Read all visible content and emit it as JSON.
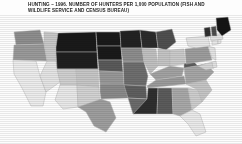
{
  "title": {
    "line1": "HUNTING – 1996.  NUMBER OF HUNTERS PER 1,000 POPULATION (FISH AND",
    "line2": "WILDLIFE SERVICE AND CENSUS BUREAU)"
  },
  "chart_data": {
    "type": "choropleth-map",
    "title": "HUNTING – 1996.  NUMBER OF HUNTERS PER 1,000 POPULATION (FISH AND WILDLIFE SERVICE AND CENSUS BUREAU)",
    "source": "Fish and Wildlife Service and Census Bureau",
    "year": "1996",
    "unit": "hunters per 1,000 population",
    "legend_shown": false,
    "region_label_shown": false,
    "shading_scheme": "grayscale halftone; darker = more hunters per 1,000 population",
    "shades": {
      "very_high": "#1a1a1a",
      "high": "#4a4a4a",
      "medium": "#8e8e8e",
      "low": "#c2c2c2",
      "very_low": "#e6e6e6"
    },
    "states": [
      {
        "code": "WA",
        "name": "Washington",
        "class": "medium",
        "fill": "#8e8e8e"
      },
      {
        "code": "OR",
        "name": "Oregon",
        "class": "medium",
        "fill": "#9a9a9a"
      },
      {
        "code": "CA",
        "name": "California",
        "class": "very_low",
        "fill": "#ececec"
      },
      {
        "code": "ID",
        "name": "Idaho",
        "class": "low",
        "fill": "#c8c8c8"
      },
      {
        "code": "NV",
        "name": "Nevada",
        "class": "very_low",
        "fill": "#e4e4e4"
      },
      {
        "code": "MT",
        "name": "Montana",
        "class": "very_high",
        "fill": "#1a1a1a"
      },
      {
        "code": "WY",
        "name": "Wyoming",
        "class": "very_high",
        "fill": "#1f1f1f"
      },
      {
        "code": "UT",
        "name": "Utah",
        "class": "low",
        "fill": "#cfcfcf"
      },
      {
        "code": "AZ",
        "name": "Arizona",
        "class": "very_low",
        "fill": "#e8e8e8"
      },
      {
        "code": "CO",
        "name": "Colorado",
        "class": "low",
        "fill": "#c6c6c6"
      },
      {
        "code": "NM",
        "name": "New Mexico",
        "class": "low",
        "fill": "#d2d2d2"
      },
      {
        "code": "ND",
        "name": "North Dakota",
        "class": "very_high",
        "fill": "#1a1a1a"
      },
      {
        "code": "SD",
        "name": "South Dakota",
        "class": "very_high",
        "fill": "#1a1a1a"
      },
      {
        "code": "NE",
        "name": "Nebraska",
        "class": "high",
        "fill": "#5a5a5a"
      },
      {
        "code": "KS",
        "name": "Kansas",
        "class": "medium",
        "fill": "#979797"
      },
      {
        "code": "OK",
        "name": "Oklahoma",
        "class": "medium",
        "fill": "#8a8a8a"
      },
      {
        "code": "TX",
        "name": "Texas",
        "class": "medium",
        "fill": "#9e9e9e"
      },
      {
        "code": "MN",
        "name": "Minnesota",
        "class": "very_high",
        "fill": "#222222"
      },
      {
        "code": "IA",
        "name": "Iowa",
        "class": "medium",
        "fill": "#8d8d8d"
      },
      {
        "code": "MO",
        "name": "Missouri",
        "class": "high",
        "fill": "#6e6e6e"
      },
      {
        "code": "AR",
        "name": "Arkansas",
        "class": "high",
        "fill": "#5f5f5f"
      },
      {
        "code": "LA",
        "name": "Louisiana",
        "class": "high",
        "fill": "#6b6b6b"
      },
      {
        "code": "WI",
        "name": "Wisconsin",
        "class": "very_high",
        "fill": "#2b2b2b"
      },
      {
        "code": "IL",
        "name": "Illinois",
        "class": "low",
        "fill": "#c0c0c0"
      },
      {
        "code": "MI",
        "name": "Michigan",
        "class": "high",
        "fill": "#4f4f4f"
      },
      {
        "code": "IN",
        "name": "Indiana",
        "class": "low",
        "fill": "#c4c4c4"
      },
      {
        "code": "OH",
        "name": "Ohio",
        "class": "low",
        "fill": "#cacaca"
      },
      {
        "code": "KY",
        "name": "Kentucky",
        "class": "medium",
        "fill": "#a2a2a2"
      },
      {
        "code": "TN",
        "name": "Tennessee",
        "class": "medium",
        "fill": "#9b9b9b"
      },
      {
        "code": "MS",
        "name": "Mississippi",
        "class": "very_high",
        "fill": "#2f2f2f"
      },
      {
        "code": "AL",
        "name": "Alabama",
        "class": "high",
        "fill": "#5b5b5b"
      },
      {
        "code": "GA",
        "name": "Georgia",
        "class": "medium",
        "fill": "#a8a8a8"
      },
      {
        "code": "FL",
        "name": "Florida",
        "class": "very_low",
        "fill": "#eaeaea"
      },
      {
        "code": "SC",
        "name": "South Carolina",
        "class": "low",
        "fill": "#cdcdcd"
      },
      {
        "code": "NC",
        "name": "North Carolina",
        "class": "low",
        "fill": "#c5c5c5"
      },
      {
        "code": "VA",
        "name": "Virginia",
        "class": "medium",
        "fill": "#a6a6a6"
      },
      {
        "code": "WV",
        "name": "West Virginia",
        "class": "high",
        "fill": "#5d5d5d"
      },
      {
        "code": "MD",
        "name": "Maryland",
        "class": "low",
        "fill": "#d6d6d6"
      },
      {
        "code": "DE",
        "name": "Delaware",
        "class": "very_low",
        "fill": "#e2e2e2"
      },
      {
        "code": "PA",
        "name": "Pennsylvania",
        "class": "medium",
        "fill": "#9d9d9d"
      },
      {
        "code": "NJ",
        "name": "New Jersey",
        "class": "very_low",
        "fill": "#e4e4e4"
      },
      {
        "code": "NY",
        "name": "New York",
        "class": "very_low",
        "fill": "#e6e6e6"
      },
      {
        "code": "CT",
        "name": "Connecticut",
        "class": "very_low",
        "fill": "#e8e8e8"
      },
      {
        "code": "RI",
        "name": "Rhode Island",
        "class": "very_low",
        "fill": "#e8e8e8"
      },
      {
        "code": "MA",
        "name": "Massachusetts",
        "class": "very_low",
        "fill": "#e4e4e4"
      },
      {
        "code": "VT",
        "name": "Vermont",
        "class": "very_high",
        "fill": "#303030"
      },
      {
        "code": "NH",
        "name": "New Hampshire",
        "class": "high",
        "fill": "#4c4c4c"
      },
      {
        "code": "ME",
        "name": "Maine",
        "class": "very_high",
        "fill": "#141414"
      }
    ]
  }
}
